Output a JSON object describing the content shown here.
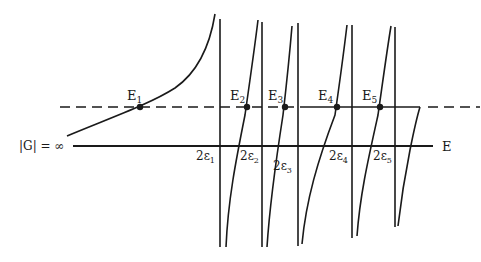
{
  "diagram": {
    "axis_label": "E",
    "infinity_label": "|G| = ∞",
    "roots": [
      {
        "label": "E",
        "sub": "1",
        "x": 140
      },
      {
        "label": "E",
        "sub": "2",
        "x": 247
      },
      {
        "label": "E",
        "sub": "3",
        "x": 285
      },
      {
        "label": "E",
        "sub": "4",
        "x": 337
      },
      {
        "label": "E",
        "sub": "5",
        "x": 380
      }
    ],
    "poles": [
      {
        "label": "2ε",
        "sub": "1"
      },
      {
        "label": "2ε",
        "sub": "2"
      },
      {
        "label": "2ε",
        "sub": "3"
      },
      {
        "label": "2ε",
        "sub": "4"
      },
      {
        "label": "2ε",
        "sub": "5"
      }
    ],
    "colors": {
      "ink": "#1a1a1a",
      "background": "#ffffff"
    }
  }
}
